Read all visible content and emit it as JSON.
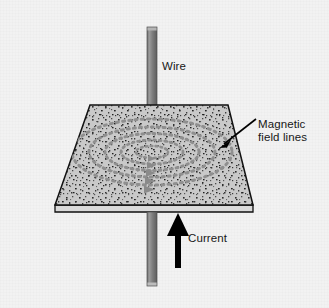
{
  "figure": {
    "background_color": "#f2f2f2"
  },
  "labels": {
    "wire": "Wire",
    "magnetic_field_lines_line1": "Magnetic",
    "magnetic_field_lines_line2": "field lines",
    "current": "Current"
  },
  "colors": {
    "wire": "#7d7d7d",
    "wire_shade_dark": "#5f5f5f",
    "wire_highlight": "#a9a9a9",
    "plate_fill": "#c9c9c9",
    "plate_edge": "#111111",
    "plate_side": "#d8d8d8",
    "field_line": "#9a9a9a",
    "field_arrow": "#8f8f8f",
    "iron_filing": "#2b2b2b",
    "label_text": "#171717",
    "current_arrow": "#000000"
  },
  "diagram_data": {
    "type": "physics-schematic",
    "subject": "Magnetic field of a straight current-carrying conductor",
    "elements": [
      {
        "name": "wire",
        "description": "Vertical straight conductor passing perpendicularly through a horizontal card",
        "orientation": "vertical",
        "top_y": 26,
        "bottom_y": 286,
        "center_x": 152,
        "width_px": 10
      },
      {
        "name": "card-plane",
        "description": "Horizontal card sprinkled with iron filings, drawn in perspective",
        "shape": "trapezoid",
        "corners": [
          [
            90,
            105
          ],
          [
            228,
            105
          ],
          [
            253,
            205
          ],
          [
            55,
            205
          ]
        ],
        "thickness_px": 6
      },
      {
        "name": "magnetic-field-lines",
        "description": "Concentric circles of iron filings around the wire, seen in perspective as ellipses",
        "count": 5,
        "direction": "clockwise viewed from above",
        "style": "dotted"
      },
      {
        "name": "field-direction-arrowheads",
        "description": "Gray arrowheads on the field circles indicating circulation direction",
        "count": 5,
        "pointing": "right"
      },
      {
        "name": "current-arrow",
        "description": "Solid black arrow beneath the card pointing upward along the wire",
        "direction": "up",
        "tail_y": 268,
        "head_y": 214,
        "x": 178
      },
      {
        "name": "magnetic-leader-line",
        "description": "Leader arrow from the Magnetic field lines caption into the card",
        "from": [
          256,
          120
        ],
        "to": [
          222,
          146
        ]
      }
    ],
    "field_circles": [
      {
        "index": 1,
        "rx": 16,
        "ry": 6,
        "cx": 152,
        "cy": 152
      },
      {
        "index": 2,
        "rx": 31,
        "ry": 12,
        "cx": 152,
        "cy": 152
      },
      {
        "index": 3,
        "rx": 47,
        "ry": 18,
        "cx": 152,
        "cy": 152
      },
      {
        "index": 4,
        "rx": 63,
        "ry": 25,
        "cx": 152,
        "cy": 152
      },
      {
        "index": 5,
        "rx": 80,
        "ry": 33,
        "cx": 152,
        "cy": 152
      }
    ]
  }
}
